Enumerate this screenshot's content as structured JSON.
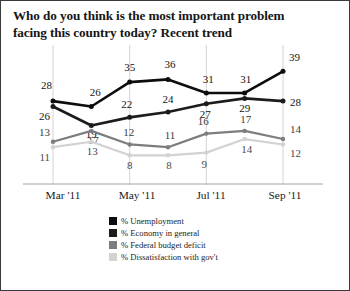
{
  "title": {
    "line1": "Who do you think is the most important problem",
    "line2": "facing this country today? Recent trend"
  },
  "xaxis": {
    "ticks": [
      {
        "label": "Mar '11",
        "x": 52
      },
      {
        "label": "May '11",
        "x": 126
      },
      {
        "label": "Jul '11",
        "x": 200
      },
      {
        "label": "Sep '11",
        "x": 274
      }
    ]
  },
  "legend": [
    {
      "label": "% Unemployment",
      "color": "#0d0d0d"
    },
    {
      "label": "% Economy in general",
      "color": "#1c1c1c"
    },
    {
      "label": "% Federal budget deficit",
      "color": "#7d7d7d"
    },
    {
      "label": "% Dissatisfaction with gov't",
      "color": "#d2d2d2"
    }
  ],
  "chart_data": {
    "type": "line",
    "title": "Who do you think is the most important problem facing this country today? Recent trend",
    "xlabel": "",
    "ylabel": "",
    "ylim": [
      0,
      45
    ],
    "grid": "vertical-at-labeled-months",
    "legend_position": "bottom-center",
    "x": [
      "Mar '11",
      "Apr '11",
      "May '11",
      "Jun '11",
      "Jul '11",
      "Aug '11",
      "Sep '11"
    ],
    "tick_labels": [
      "Mar '11",
      "May '11",
      "Jul '11",
      "Sep '11"
    ],
    "series": [
      {
        "name": "% Unemployment",
        "color": "#0d0d0d",
        "values": [
          28,
          26,
          35,
          36,
          31,
          31,
          39
        ]
      },
      {
        "name": "% Economy in general",
        "color": "#1c1c1c",
        "values": [
          26,
          19,
          22,
          24,
          27,
          29,
          28
        ]
      },
      {
        "name": "% Federal budget deficit",
        "color": "#7d7d7d",
        "values": [
          13,
          17,
          12,
          11,
          16,
          17,
          14
        ]
      },
      {
        "name": "% Dissatisfaction with gov't",
        "color": "#d2d2d2",
        "values": [
          11,
          13,
          8,
          8,
          9,
          14,
          12
        ]
      }
    ]
  }
}
